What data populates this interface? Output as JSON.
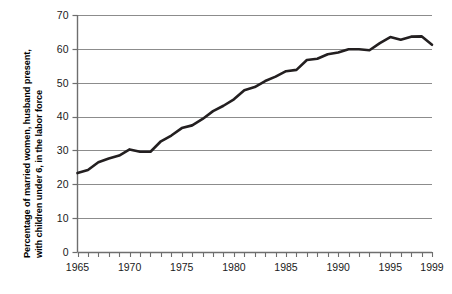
{
  "chart_data": {
    "type": "line",
    "title": "",
    "xlabel": "",
    "ylabel": "Percentage of married women, husband present, with children under 6, in the labor force",
    "ylabel_line1": "Percentage of married women, husband present,",
    "ylabel_line2": "with children under 6, in the labor force",
    "xlim": [
      1965,
      1999
    ],
    "ylim": [
      0,
      70
    ],
    "ytick_labels": [
      "0",
      "10",
      "20",
      "30",
      "40",
      "50",
      "60",
      "70"
    ],
    "ytick_values": [
      0,
      10,
      20,
      30,
      40,
      50,
      60,
      70
    ],
    "xtick_labels": [
      "1965",
      "1970",
      "1975",
      "1980",
      "1985",
      "1990",
      "1995",
      "1999"
    ],
    "xtick_values": [
      1965,
      1970,
      1975,
      1980,
      1985,
      1990,
      1995,
      1999
    ],
    "minor_xticks_every": 1,
    "grid": "horizontal",
    "legend": "none",
    "line_color": "#231f20",
    "grid_color": "#8c8c8c",
    "axis_color": "#6e6e6e",
    "x": [
      1965,
      1966,
      1967,
      1968,
      1969,
      1970,
      1971,
      1972,
      1973,
      1974,
      1975,
      1976,
      1977,
      1978,
      1979,
      1980,
      1981,
      1982,
      1983,
      1984,
      1985,
      1986,
      1987,
      1988,
      1989,
      1990,
      1991,
      1992,
      1993,
      1994,
      1995,
      1996,
      1997,
      1998,
      1999
    ],
    "values": [
      23.3,
      24.2,
      26.5,
      27.6,
      28.5,
      30.3,
      29.6,
      29.6,
      32.7,
      34.4,
      36.6,
      37.4,
      39.3,
      41.6,
      43.2,
      45.1,
      47.8,
      48.7,
      50.5,
      51.8,
      53.4,
      53.8,
      56.7,
      57.1,
      58.4,
      58.9,
      59.9,
      59.9,
      59.6,
      61.7,
      63.5,
      62.7,
      63.6,
      63.7,
      61.2
    ],
    "series_name": "Percentage in labor force"
  },
  "axis": {
    "y_axis_name": "y-axis",
    "x_axis_name": "x-axis"
  }
}
